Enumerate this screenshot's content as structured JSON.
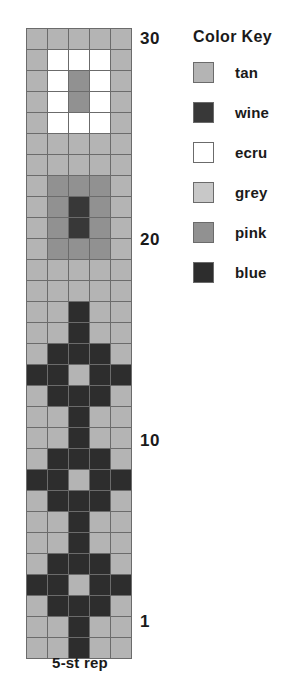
{
  "legend": {
    "title": "Color Key",
    "entries": [
      {
        "name": "tan",
        "label": "tan",
        "hex": "#b4b4b4"
      },
      {
        "name": "wine",
        "label": "wine",
        "hex": "#383838"
      },
      {
        "name": "ecru",
        "label": "ecru",
        "hex": "#ffffff"
      },
      {
        "name": "grey",
        "label": "grey",
        "hex": "#c8c8c8"
      },
      {
        "name": "pink",
        "label": "pink",
        "hex": "#919191"
      },
      {
        "name": "blue",
        "label": "blue",
        "hex": "#2d2d2d"
      }
    ]
  },
  "caption": "5-st rep",
  "row_labels": [
    {
      "row": 30,
      "text": "30"
    },
    {
      "row": 20,
      "text": "20"
    },
    {
      "row": 10,
      "text": "10"
    },
    {
      "row": 1,
      "text": "1"
    }
  ],
  "chart_data": {
    "type": "heatmap",
    "title": "",
    "xlabel": "5-st rep",
    "ylabel": "",
    "columns": 5,
    "rows": 30,
    "legend_position": "right",
    "grid": true,
    "colors": {
      "tan": "#b4b4b4",
      "wine": "#383838",
      "ecru": "#ffffff",
      "grey": "#c8c8c8",
      "pink": "#919191",
      "blue": "#2d2d2d"
    },
    "categories": [
      "1",
      "2",
      "3",
      "4",
      "5"
    ],
    "row_numbers": [
      30,
      29,
      28,
      27,
      26,
      25,
      24,
      23,
      22,
      21,
      20,
      19,
      18,
      17,
      16,
      15,
      14,
      13,
      12,
      11,
      10,
      9,
      8,
      7,
      6,
      5,
      4,
      3,
      2,
      1
    ],
    "cells": [
      [
        "tan",
        "tan",
        "tan",
        "tan",
        "tan"
      ],
      [
        "tan",
        "ecru",
        "ecru",
        "ecru",
        "tan"
      ],
      [
        "tan",
        "ecru",
        "pink",
        "ecru",
        "tan"
      ],
      [
        "tan",
        "ecru",
        "pink",
        "ecru",
        "tan"
      ],
      [
        "tan",
        "ecru",
        "ecru",
        "ecru",
        "tan"
      ],
      [
        "tan",
        "tan",
        "tan",
        "tan",
        "tan"
      ],
      [
        "tan",
        "tan",
        "tan",
        "tan",
        "tan"
      ],
      [
        "tan",
        "pink",
        "pink",
        "pink",
        "tan"
      ],
      [
        "tan",
        "pink",
        "wine",
        "pink",
        "tan"
      ],
      [
        "tan",
        "pink",
        "wine",
        "pink",
        "tan"
      ],
      [
        "tan",
        "pink",
        "pink",
        "pink",
        "tan"
      ],
      [
        "tan",
        "tan",
        "tan",
        "tan",
        "tan"
      ],
      [
        "tan",
        "tan",
        "tan",
        "tan",
        "tan"
      ],
      [
        "tan",
        "tan",
        "blue",
        "tan",
        "tan"
      ],
      [
        "tan",
        "tan",
        "blue",
        "tan",
        "tan"
      ],
      [
        "tan",
        "blue",
        "blue",
        "blue",
        "tan"
      ],
      [
        "blue",
        "blue",
        "tan",
        "blue",
        "blue"
      ],
      [
        "tan",
        "blue",
        "blue",
        "blue",
        "tan"
      ],
      [
        "tan",
        "tan",
        "blue",
        "tan",
        "tan"
      ],
      [
        "tan",
        "tan",
        "blue",
        "tan",
        "tan"
      ],
      [
        "tan",
        "blue",
        "blue",
        "blue",
        "tan"
      ],
      [
        "blue",
        "blue",
        "tan",
        "blue",
        "blue"
      ],
      [
        "tan",
        "blue",
        "blue",
        "blue",
        "tan"
      ],
      [
        "tan",
        "tan",
        "blue",
        "tan",
        "tan"
      ],
      [
        "tan",
        "tan",
        "blue",
        "tan",
        "tan"
      ],
      [
        "tan",
        "blue",
        "blue",
        "blue",
        "tan"
      ],
      [
        "blue",
        "blue",
        "tan",
        "blue",
        "blue"
      ],
      [
        "tan",
        "blue",
        "blue",
        "blue",
        "tan"
      ],
      [
        "tan",
        "tan",
        "blue",
        "tan",
        "tan"
      ],
      [
        "tan",
        "tan",
        "blue",
        "tan",
        "tan"
      ]
    ]
  }
}
